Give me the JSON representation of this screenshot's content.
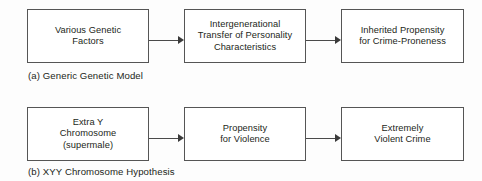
{
  "figure": {
    "background_color": "#fdfdfd",
    "box_border_color": "#555555",
    "arrow_color": "#3a3a3a",
    "text_color": "#231f20"
  },
  "models": [
    {
      "id": "generic-genetic-model",
      "caption": "(a) Generic Genetic Model",
      "boxes": [
        {
          "id": "various-genetic-factors",
          "lines": [
            "Various Genetic",
            "Factors"
          ],
          "text": "Various Genetic\nFactors"
        },
        {
          "id": "intergenerational-transfer",
          "lines": [
            "Intergenerational",
            "Transfer of Personality",
            "Characteristics"
          ],
          "text": "Intergenerational\nTransfer of Personality\nCharacteristics"
        },
        {
          "id": "inherited-propensity",
          "lines": [
            "Inherited Propensity",
            "for Crime-Proneness"
          ],
          "text": "Inherited Propensity\nfor Crime-Proneness"
        }
      ],
      "arrows": [
        {
          "id": "arrow-factors-to-transfer",
          "from": "various-genetic-factors",
          "to": "intergenerational-transfer"
        },
        {
          "id": "arrow-transfer-to-propensity",
          "from": "intergenerational-transfer",
          "to": "inherited-propensity"
        }
      ]
    },
    {
      "id": "xyy-chromosome-hypothesis",
      "caption": "(b) XYY Chromosome Hypothesis",
      "boxes": [
        {
          "id": "extra-y-chromosome",
          "lines": [
            "Extra Y",
            "Chromosome",
            "(supermale)"
          ],
          "text": "Extra Y\nChromosome\n(supermale)"
        },
        {
          "id": "propensity-for-violence",
          "lines": [
            "Propensity",
            "for Violence"
          ],
          "text": "Propensity\nfor Violence"
        },
        {
          "id": "extremely-violent-crime",
          "lines": [
            "Extremely",
            "Violent Crime"
          ],
          "text": "Extremely\nViolent Crime"
        }
      ],
      "arrows": [
        {
          "id": "arrow-chromosome-to-violence",
          "from": "extra-y-chromosome",
          "to": "propensity-for-violence"
        },
        {
          "id": "arrow-violence-to-crime",
          "from": "propensity-for-violence",
          "to": "extremely-violent-crime"
        }
      ]
    }
  ]
}
